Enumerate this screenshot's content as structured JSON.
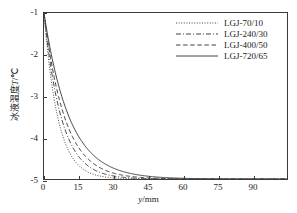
{
  "chart_data": {
    "type": "line",
    "title": "",
    "xlabel": "y/mm",
    "ylabel": "冰液温度T/℃",
    "xlabel_symbol": "y",
    "xlabel_unit": "/mm",
    "ylabel_text": "冰液温度",
    "ylabel_symbol": "T",
    "ylabel_unit": "/℃",
    "xlim": [
      0,
      105
    ],
    "ylim": [
      -5,
      -1
    ],
    "xticks": [
      0,
      15,
      30,
      45,
      60,
      75,
      90
    ],
    "yticks": [
      -1,
      -2,
      -3,
      -4,
      -5
    ],
    "xticklabels": [
      "0",
      "15",
      "30",
      "45",
      "60",
      "75",
      "90"
    ],
    "yticklabels": [
      "-1",
      "-2",
      "-3",
      "-4",
      "-5"
    ],
    "grid": false,
    "legend_position": "upper right",
    "asymptote": -5,
    "start_value": -1,
    "series": [
      {
        "name": "LGJ-70/10",
        "style": "dotted",
        "color": "#444444",
        "decay_constant": 6.0,
        "x": [
          0,
          2,
          4,
          6,
          8,
          10,
          12,
          15,
          18,
          21,
          24,
          27,
          30,
          35,
          40,
          45,
          50,
          60,
          75,
          90,
          105
        ],
        "y": [
          -1.0,
          -2.13,
          -2.95,
          -3.53,
          -3.95,
          -4.24,
          -4.45,
          -4.67,
          -4.8,
          -4.88,
          -4.93,
          -4.95,
          -4.97,
          -4.99,
          -4.99,
          -5.0,
          -5.0,
          -5.0,
          -5.0,
          -5.0,
          -5.0
        ]
      },
      {
        "name": "LGJ-240/30",
        "style": "dashdot",
        "color": "#444444",
        "decay_constant": 7.5,
        "x": [
          0,
          2,
          4,
          6,
          8,
          10,
          12,
          15,
          18,
          21,
          24,
          27,
          30,
          35,
          40,
          45,
          50,
          60,
          75,
          90,
          105
        ],
        "y": [
          -1.0,
          -1.94,
          -2.66,
          -3.22,
          -3.64,
          -3.97,
          -4.22,
          -4.5,
          -4.68,
          -4.8,
          -4.87,
          -4.92,
          -4.95,
          -4.98,
          -4.99,
          -4.99,
          -5.0,
          -5.0,
          -5.0,
          -5.0,
          -5.0
        ]
      },
      {
        "name": "LGJ-400/50",
        "style": "dashed",
        "color": "#444444",
        "decay_constant": 9.0,
        "x": [
          0,
          2,
          4,
          6,
          8,
          10,
          12,
          15,
          18,
          21,
          24,
          27,
          30,
          35,
          40,
          45,
          50,
          60,
          75,
          90,
          105
        ],
        "y": [
          -1.0,
          -1.8,
          -2.44,
          -2.95,
          -3.37,
          -3.7,
          -3.96,
          -4.28,
          -4.5,
          -4.66,
          -4.77,
          -4.84,
          -4.89,
          -4.95,
          -4.97,
          -4.99,
          -4.99,
          -5.0,
          -5.0,
          -5.0,
          -5.0
        ]
      },
      {
        "name": "LGJ-720/65",
        "style": "solid",
        "color": "#444444",
        "decay_constant": 11.0,
        "x": [
          0,
          2,
          4,
          6,
          8,
          10,
          12,
          15,
          18,
          21,
          24,
          27,
          30,
          35,
          40,
          45,
          50,
          60,
          75,
          90,
          105
        ],
        "y": [
          -1.0,
          -1.66,
          -2.22,
          -2.69,
          -3.08,
          -3.41,
          -3.69,
          -4.03,
          -4.28,
          -4.47,
          -4.61,
          -4.71,
          -4.79,
          -4.88,
          -4.93,
          -4.96,
          -4.98,
          -4.99,
          -5.0,
          -5.0,
          -5.0
        ]
      }
    ]
  },
  "legend": {
    "items": [
      {
        "label": "LGJ-70/10"
      },
      {
        "label": "LGJ-240/30"
      },
      {
        "label": "LGJ-400/50"
      },
      {
        "label": "LGJ-720/65"
      }
    ]
  }
}
